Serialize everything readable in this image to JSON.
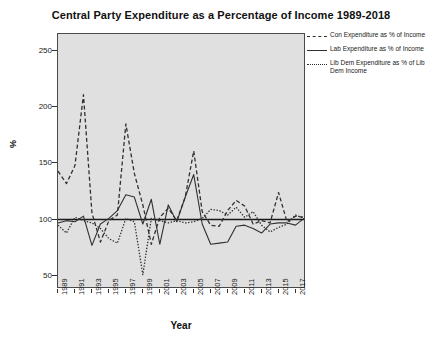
{
  "chart_data": {
    "type": "line",
    "title": "Central Party Expenditure as a Percentage of Income 1989-2018",
    "xlabel": "Year",
    "ylabel": "%",
    "grid": false,
    "legend_position": "right",
    "xlim": [
      1989,
      2018
    ],
    "ylim": [
      40,
      265
    ],
    "yticks": [
      50,
      100,
      150,
      200,
      250
    ],
    "xticks": [
      1989,
      1991,
      1993,
      1995,
      1997,
      1999,
      2001,
      2003,
      2005,
      2007,
      2009,
      2011,
      2013,
      2015,
      2017
    ],
    "reference_line": 100,
    "x": [
      1989,
      1990,
      1991,
      1992,
      1993,
      1994,
      1995,
      1996,
      1997,
      1998,
      1999,
      2000,
      2001,
      2002,
      2003,
      2004,
      2005,
      2006,
      2007,
      2008,
      2009,
      2010,
      2011,
      2012,
      2013,
      2014,
      2015,
      2016,
      2017,
      2018
    ],
    "series": [
      {
        "name": "Con Expenditure as % of Income",
        "style": "dashed",
        "color": "#303030",
        "values": [
          143,
          132,
          148,
          211,
          106,
          80,
          99,
          104,
          185,
          141,
          113,
          78,
          102,
          110,
          99,
          120,
          161,
          107,
          95,
          94,
          108,
          117,
          112,
          96,
          99,
          97,
          124,
          98,
          103,
          102
        ]
      },
      {
        "name": "Lab Expenditure as % of Income",
        "style": "solid",
        "color": "#303030",
        "values": [
          97,
          99,
          98,
          103,
          77,
          96,
          101,
          108,
          122,
          120,
          96,
          118,
          78,
          113,
          98,
          120,
          140,
          96,
          78,
          79,
          80,
          94,
          95,
          92,
          88,
          96,
          97,
          97,
          95,
          101
        ]
      },
      {
        "name": "Lib Dem Expenditure as % of Lib Dem Income",
        "style": "dotted",
        "color": "#303030",
        "values": [
          95,
          88,
          102,
          99,
          97,
          92,
          83,
          79,
          101,
          98,
          51,
          101,
          99,
          97,
          99,
          97,
          98,
          101,
          109,
          108,
          104,
          111,
          102,
          107,
          95,
          89,
          93,
          96,
          104,
          101
        ]
      }
    ]
  },
  "legend": {
    "items": [
      {
        "label": "Con Expenditure as % of Income",
        "style": "dashed"
      },
      {
        "label": "Lab Expenditure as % of Income",
        "style": "solid"
      },
      {
        "label": "Lib Dem Expenditure as % of Lib Dem Income",
        "style": "dotted"
      }
    ]
  }
}
